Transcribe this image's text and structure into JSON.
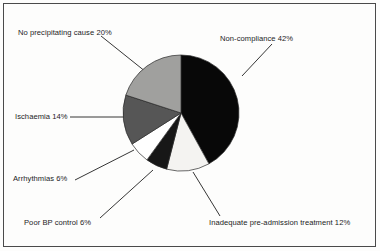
{
  "chart_data": {
    "type": "pie",
    "title": "",
    "subtitle": "",
    "xlabel": "",
    "ylabel": "",
    "legend_position": "callout-labels",
    "grid": false,
    "start_angle_deg": 0,
    "direction": "clockwise",
    "center": {
      "x": 180,
      "y": 112
    },
    "radius": 58,
    "categories": [
      "Non-compliance",
      "Inadequate pre-admission treatment",
      "Poor BP control",
      "Arrhythmias",
      "Ischaemia",
      "No precipitating cause"
    ],
    "values": [
      42,
      12,
      6,
      6,
      14,
      20
    ],
    "units": "%",
    "colors": [
      "#080808",
      "#f4f3f1",
      "#171717",
      "#ffffff",
      "#565656",
      "#a0a09e"
    ],
    "slices": [
      {
        "label": "Non-compliance 42%",
        "name": "Non-compliance",
        "value": 42,
        "color": "#080808",
        "start_deg": 0,
        "end_deg": 151.2
      },
      {
        "label": "Inadequate pre-admission treatment 12%",
        "name": "Inadequate pre-admission treatment",
        "value": 12,
        "color": "#f4f3f1",
        "start_deg": 151.2,
        "end_deg": 194.4
      },
      {
        "label": "Poor BP control 6%",
        "name": "Poor BP control",
        "value": 6,
        "color": "#171717",
        "start_deg": 194.4,
        "end_deg": 216.0
      },
      {
        "label": "Arrhythmias 6%",
        "name": "Arrhythmias",
        "value": 6,
        "color": "#ffffff",
        "start_deg": 216.0,
        "end_deg": 237.6
      },
      {
        "label": "Ischaemia 14%",
        "name": "Ischaemia",
        "value": 14,
        "color": "#565656",
        "start_deg": 237.6,
        "end_deg": 288.0
      },
      {
        "label": "No precipitating cause 20%",
        "name": "No precipitating cause",
        "value": 20,
        "color": "#a0a09e",
        "start_deg": 288.0,
        "end_deg": 360.0
      }
    ]
  },
  "figure": {
    "border_color": "#4a4a4a",
    "background": "#fdfdfc",
    "text_color": "#1c1c1c",
    "leader_line_color": "#1f1f1f"
  }
}
